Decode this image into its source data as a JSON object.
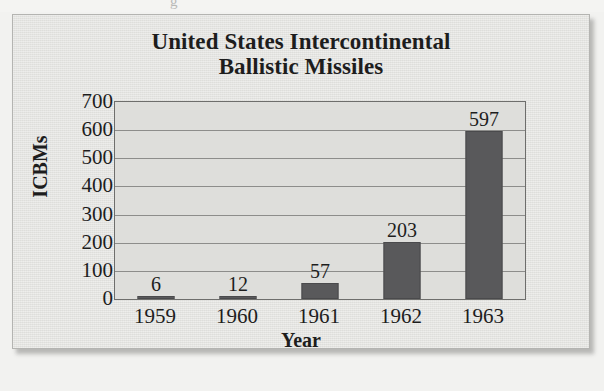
{
  "chart_data": {
    "type": "bar",
    "title": "United States Intercontinental Ballistic Missiles",
    "title_line1": "United States Intercontinental",
    "title_line2": "Ballistic Missiles",
    "xlabel": "Year",
    "ylabel": "ICBMs",
    "categories": [
      "1959",
      "1960",
      "1961",
      "1962",
      "1963"
    ],
    "values": [
      6,
      12,
      57,
      203,
      597
    ],
    "value_labels": [
      "6",
      "12",
      "57",
      "203",
      "597"
    ],
    "ylim": [
      0,
      700
    ],
    "ytick_labels": [
      "700",
      "600",
      "500",
      "400",
      "300",
      "200",
      "100",
      "0"
    ],
    "ytick_values": [
      700,
      600,
      500,
      400,
      300,
      200,
      100,
      0
    ],
    "ytick_step": 100,
    "grid": "horizontal",
    "legend": "none",
    "bar_color": "#59595b",
    "plot_background": "#dededb",
    "page_background": "#e4e4e1",
    "axis_color": "#6e6e6c",
    "gridline_color": "#8d8d8b",
    "text_color": "#1d1d1d"
  },
  "scan": {
    "top_artifact_glyph": "g"
  }
}
